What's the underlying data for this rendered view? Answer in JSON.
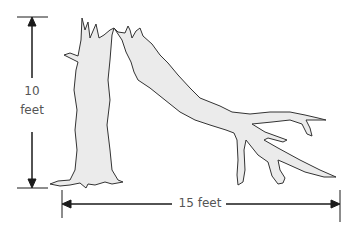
{
  "diagram": {
    "height_label_line1": "10",
    "height_label_line2": "feet",
    "width_label": "15 feet",
    "colors": {
      "tree_fill": "#ebebeb",
      "tree_stroke": "#333333",
      "arrow": "#1a1a1a",
      "text": "#555555"
    }
  }
}
